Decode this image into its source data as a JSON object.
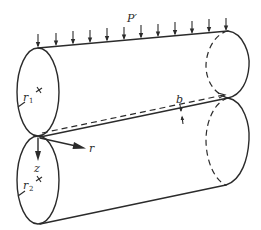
{
  "diagram": {
    "labels": {
      "load": "P′",
      "half_width": "b",
      "radius_top": "r",
      "radius_top_sub": "1",
      "radius_bottom": "r",
      "radius_bottom_sub": "2",
      "axis_z": "z",
      "axis_r": "r"
    },
    "elements": {
      "load_arrow_count": 12,
      "top_cylinder": "cylinder of radius r1",
      "bottom_cylinder": "cylinder of radius r2",
      "contact_line": "line of contact with half-width b"
    },
    "colors": {
      "ink": "#2b2b2b",
      "background": "#ffffff"
    }
  }
}
